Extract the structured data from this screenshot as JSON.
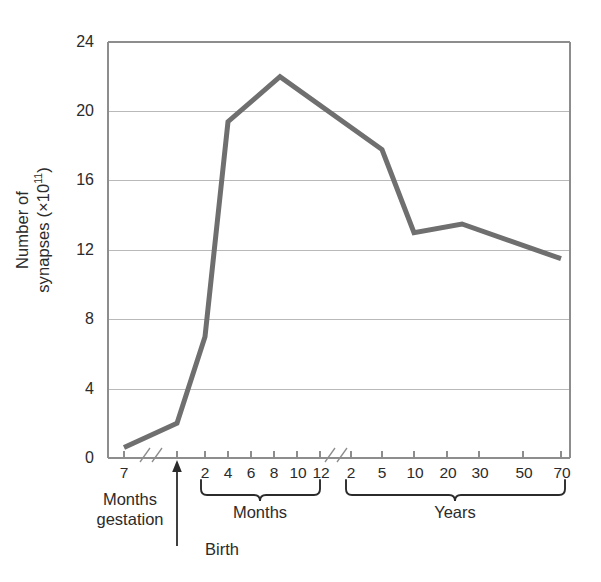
{
  "chart_data": {
    "type": "line",
    "title": "",
    "subtitle": "",
    "xlabel": "",
    "ylabel": "Number of synapses (×10¹¹)",
    "ylabel_line1": "Number of",
    "ylabel_line2_prefix": "synapses (×10",
    "ylabel_line2_sup": "11",
    "ylabel_line2_suffix": ")",
    "ylim": [
      0,
      24
    ],
    "yticks": [
      0,
      4,
      8,
      12,
      16,
      20,
      24
    ],
    "ytick_labels": [
      "0",
      "4",
      "8",
      "12",
      "16",
      "20",
      "24"
    ],
    "grid": true,
    "grid_axis": "y",
    "legend": "none",
    "axis_breaks": 2,
    "line_color": "#6f6f6f",
    "grid_color": "#b9b9b9",
    "axis_color": "#8d8d8d",
    "x_sections": [
      {
        "name": "gestation",
        "caption_line1": "Months",
        "caption_line2": "gestation",
        "bracket": false,
        "ticks": [
          "7"
        ]
      },
      {
        "name": "birth",
        "caption_line1": "Birth",
        "caption_line2": "",
        "bracket": false,
        "ticks": [
          ""
        ]
      },
      {
        "name": "months",
        "caption_line1": "Months",
        "caption_line2": "",
        "bracket": true,
        "ticks": [
          "2",
          "4",
          "6",
          "8",
          "10",
          "12"
        ]
      },
      {
        "name": "years",
        "caption_line1": "Years",
        "caption_line2": "",
        "bracket": true,
        "ticks": [
          "2",
          "5",
          "10",
          "20",
          "30",
          "50",
          "70"
        ]
      }
    ],
    "x_labels": [
      "7",
      "Birth",
      "2",
      "4",
      "6",
      "8",
      "10",
      "12",
      "2",
      "5",
      "10",
      "20",
      "30",
      "50",
      "70"
    ],
    "points": [
      {
        "label": "7 months gestation",
        "value": 0.6
      },
      {
        "label": "Birth",
        "value": 2.0
      },
      {
        "label": "2 months",
        "value": 7.0
      },
      {
        "label": "4 months",
        "value": 19.4
      },
      {
        "label": "8 months",
        "value": 22.0
      },
      {
        "label": "5 years",
        "value": 17.8
      },
      {
        "label": "10 years",
        "value": 13.0
      },
      {
        "label": "25 years",
        "value": 13.5
      },
      {
        "label": "70 years",
        "value": 11.5
      }
    ],
    "values": [
      0.6,
      2.0,
      7.0,
      19.4,
      22.0,
      17.8,
      13.0,
      13.5,
      11.5
    ],
    "annotations": [
      {
        "text": "Birth",
        "kind": "arrow-up-to-axis"
      },
      {
        "text": "Months gestation",
        "kind": "section-caption"
      },
      {
        "text": "Months",
        "kind": "section-caption-bracket"
      },
      {
        "text": "Years",
        "kind": "section-caption-bracket"
      }
    ]
  }
}
